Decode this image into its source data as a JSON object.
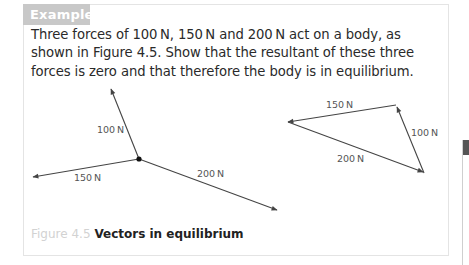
{
  "example": {
    "tab_label": "Example",
    "question": "Three forces of 100 N, 150 N and 200 N act on a body, as shown in Figure 4.5. Show that the resultant of these three forces is zero and that therefore the body is in equilibrium."
  },
  "figure": {
    "number": "Figure 4.5",
    "title": "Vectors in equilibrium",
    "left_diagram": {
      "forces": [
        {
          "label": "100 N"
        },
        {
          "label": "150 N"
        },
        {
          "label": "200 N"
        }
      ]
    },
    "right_diagram": {
      "sides": [
        {
          "label": "150 N"
        },
        {
          "label": "100 N"
        },
        {
          "label": "200 N"
        }
      ]
    }
  },
  "colors": {
    "tab_bg": "#c8c8c8",
    "line": "#444444",
    "caption_number": "#d2d2d2"
  }
}
